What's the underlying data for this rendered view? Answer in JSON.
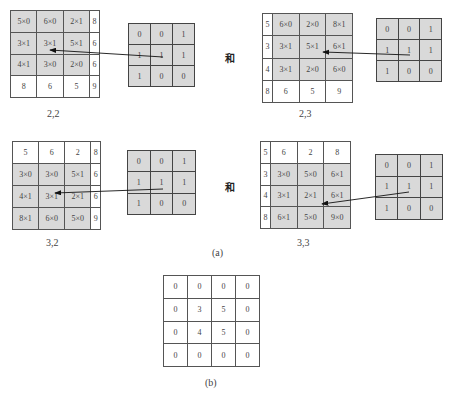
{
  "conjunction": "和",
  "panels": [
    {
      "label": "2,2",
      "grid": [
        [
          "5×0",
          "6×0",
          "2×1",
          "8"
        ],
        [
          "3×1",
          "3×1",
          "5×1",
          "6"
        ],
        [
          "4×1",
          "3×0",
          "2×0",
          "6"
        ],
        [
          "8",
          "6",
          "5",
          "9"
        ]
      ],
      "highlight": [
        [
          1,
          1,
          1,
          0
        ],
        [
          1,
          1,
          1,
          0
        ],
        [
          1,
          1,
          1,
          0
        ],
        [
          0,
          0,
          0,
          0
        ]
      ],
      "kernel": [
        [
          "0",
          "0",
          "1"
        ],
        [
          "1",
          "1",
          "1"
        ],
        [
          "1",
          "0",
          "0"
        ]
      ]
    },
    {
      "label": "2,3",
      "grid": [
        [
          "5",
          "6×0",
          "2×0",
          "8×1"
        ],
        [
          "3",
          "3×1",
          "5×1",
          "6×1"
        ],
        [
          "4",
          "3×1",
          "2×0",
          "6×0"
        ],
        [
          "8",
          "6",
          "5",
          "9"
        ]
      ],
      "highlight": [
        [
          0,
          1,
          1,
          1
        ],
        [
          0,
          1,
          1,
          1
        ],
        [
          0,
          1,
          1,
          1
        ],
        [
          0,
          0,
          0,
          0
        ]
      ],
      "kernel": [
        [
          "0",
          "0",
          "1"
        ],
        [
          "1",
          "1",
          "1"
        ],
        [
          "1",
          "0",
          "0"
        ]
      ]
    },
    {
      "label": "3,2",
      "grid": [
        [
          "5",
          "6",
          "2",
          "8"
        ],
        [
          "3×0",
          "3×0",
          "5×1",
          "6"
        ],
        [
          "4×1",
          "3×1",
          "2×1",
          "6"
        ],
        [
          "8×1",
          "6×0",
          "5×0",
          "9"
        ]
      ],
      "highlight": [
        [
          0,
          0,
          0,
          0
        ],
        [
          1,
          1,
          1,
          0
        ],
        [
          1,
          1,
          1,
          0
        ],
        [
          1,
          1,
          1,
          0
        ]
      ],
      "kernel": [
        [
          "0",
          "0",
          "1"
        ],
        [
          "1",
          "1",
          "1"
        ],
        [
          "1",
          "0",
          "0"
        ]
      ]
    },
    {
      "label": "3,3",
      "grid": [
        [
          "5",
          "6",
          "2",
          "8"
        ],
        [
          "3",
          "3×0",
          "5×0",
          "6×1"
        ],
        [
          "4",
          "3×1",
          "2×1",
          "6×1"
        ],
        [
          "8",
          "6×1",
          "5×0",
          "9×0"
        ]
      ],
      "highlight": [
        [
          0,
          0,
          0,
          0
        ],
        [
          0,
          1,
          1,
          1
        ],
        [
          0,
          1,
          1,
          1
        ],
        [
          0,
          1,
          1,
          1
        ]
      ],
      "kernel": [
        [
          "0",
          "0",
          "1"
        ],
        [
          "1",
          "1",
          "1"
        ],
        [
          "1",
          "0",
          "0"
        ]
      ]
    }
  ],
  "caption_a": "(a)",
  "result": {
    "grid": [
      [
        "0",
        "0",
        "0",
        "0"
      ],
      [
        "0",
        "3",
        "5",
        "0"
      ],
      [
        "0",
        "4",
        "5",
        "0"
      ],
      [
        "0",
        "0",
        "0",
        "0"
      ]
    ],
    "caption": "(b)"
  }
}
